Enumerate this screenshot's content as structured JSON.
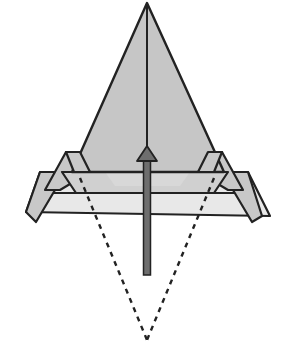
{
  "diagram": {
    "type": "origami-fold-step",
    "colors": {
      "background": "#ffffff",
      "paper_dark": "#c8c8c8",
      "paper_light": "#e6e6e6",
      "stroke": "#222222",
      "arrow_fill": "#6e6e6e",
      "dashed_line": "#222222"
    },
    "elements": [
      {
        "id": "main-triangle",
        "kind": "paper-flap"
      },
      {
        "id": "center-crease",
        "kind": "crease-line"
      },
      {
        "id": "horizontal-band",
        "kind": "paper-layer"
      },
      {
        "id": "left-pleat",
        "kind": "paper-flap"
      },
      {
        "id": "right-pleat",
        "kind": "paper-flap"
      },
      {
        "id": "hidden-point-outline",
        "kind": "dashed-fold-line"
      },
      {
        "id": "fold-up-arrow",
        "kind": "arrow",
        "direction": "up"
      }
    ]
  }
}
